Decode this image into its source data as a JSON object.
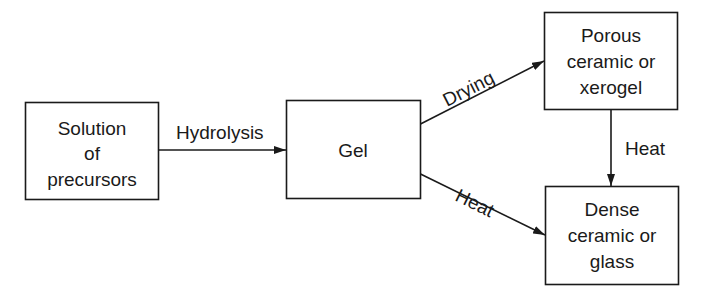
{
  "diagram": {
    "type": "flowchart",
    "colors": {
      "stroke": "#1a1a1a",
      "background": "#ffffff"
    },
    "nodes": {
      "solution": {
        "lines": [
          "Solution",
          "of",
          "precursors"
        ]
      },
      "gel": {
        "lines": [
          "Gel"
        ]
      },
      "porous": {
        "lines": [
          "Porous",
          "ceramic or",
          "xerogel"
        ]
      },
      "dense": {
        "lines": [
          "Dense",
          "ceramic or",
          "glass"
        ]
      }
    },
    "edges": {
      "hydrolysis": {
        "from": "solution",
        "to": "gel",
        "label": "Hydrolysis"
      },
      "drying": {
        "from": "gel",
        "to": "porous",
        "label": "Drying"
      },
      "heat_gel_dense": {
        "from": "gel",
        "to": "dense",
        "label": "Heat"
      },
      "heat_porous_dense": {
        "from": "porous",
        "to": "dense",
        "label": "Heat"
      }
    }
  }
}
